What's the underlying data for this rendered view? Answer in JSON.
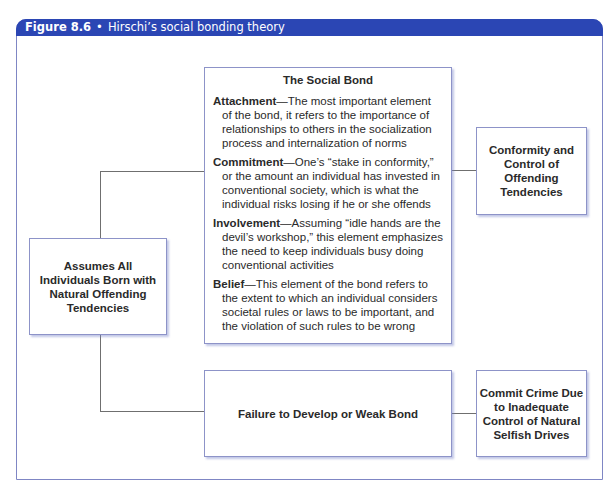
{
  "figure": {
    "number": "Figure 8.6",
    "separator": "•",
    "title": "Hirschi’s social bonding theory",
    "header_color": "#2b46b4",
    "border_color": "#7f86c4"
  },
  "nodes": {
    "origin": "Assumes All Individuals Born with Natural Offending Tendencies",
    "social_bond": {
      "title": "The Social Bond",
      "elements": [
        {
          "term": "Attachment",
          "dash": "—",
          "text": "The most important element of the bond, it refers to the importance of relationships to others in the socialization process and internalization of norms"
        },
        {
          "term": "Commitment",
          "dash": "—",
          "text": "One’s “stake in conformity,” or the amount an individual has invested in conventional society, which is what the individual risks losing if he or she offends"
        },
        {
          "term": "Involvement",
          "dash": "—",
          "text": "Assuming “idle hands are the devil’s workshop,” this element emphasizes the need to keep individuals busy doing conventional activities"
        },
        {
          "term": "Belief",
          "dash": "—",
          "text": "This element of the bond refers to the extent to which an individual considers societal rules or laws to be important, and the violation of such rules to be wrong"
        }
      ]
    },
    "conformity": "Conformity and Control of Offending Tendencies",
    "failure": "Failure to Develop or Weak Bond",
    "crime": "Commit Crime Due to Inadequate Control of Natural Selfish Drives"
  },
  "edges": [
    {
      "from": "origin",
      "to": "social_bond"
    },
    {
      "from": "social_bond",
      "to": "conformity"
    },
    {
      "from": "origin",
      "to": "failure"
    },
    {
      "from": "failure",
      "to": "crime"
    }
  ]
}
